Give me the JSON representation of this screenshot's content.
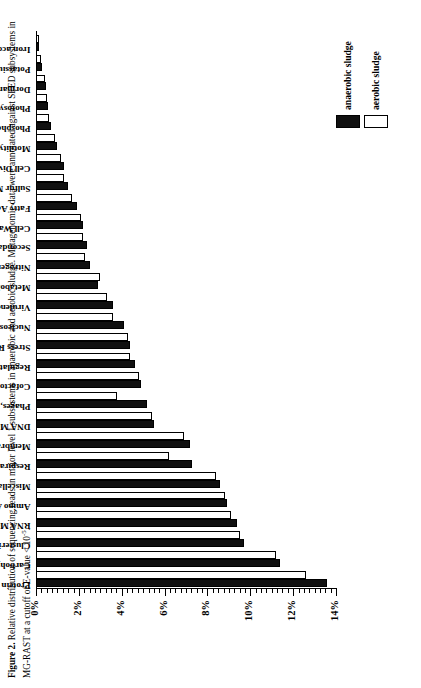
{
  "caption": {
    "label": "Figure 2.",
    "text": " Relative distribution of sequencing reads in major level 1 subsystems in anaerobic and aerobic sludge. Metagenomic data were annotated against SEED subsystems in MG-RAST at a cutoff of E-value < 10",
    "exponent": "-5",
    "tail": "."
  },
  "legend": {
    "position": "bottom-right",
    "items": [
      {
        "name": "anaerobic sludge",
        "color": "#101010"
      },
      {
        "name": "aerobic sludge",
        "color": "#ffffff"
      }
    ]
  },
  "chart_data": {
    "type": "bar",
    "orientation": "vertical",
    "title": "",
    "xlabel": "",
    "ylabel": "",
    "ylim": [
      0,
      14
    ],
    "ytick_labels": [
      "0%",
      "2%",
      "4%",
      "6%",
      "8%",
      "10%",
      "12%",
      "14%"
    ],
    "ytick_values": [
      0,
      2,
      4,
      6,
      8,
      10,
      12,
      14
    ],
    "grid": false,
    "minor_ticks": true,
    "categories": [
      "Protein Metabolism",
      "Carbohydrates",
      "Clustering-based subsystems",
      "RNA Metabolism",
      "Amino Acids and Derivatives",
      "Miscellaneous",
      "Respiration",
      "Membrane Transport",
      "DNA Metabolism",
      "Phages, Prophages, Transposable elements, Plasmids",
      "Cofactors, Vitamins, Prosthetic Groups, Pigments",
      "Regulation and Cell signaling",
      "Stress Response",
      "Nucleosides and Nucleotides",
      "Virulence, Disease and Defense",
      "Metabolism of Aromatic Compounds",
      "Nitrogen Metabolism",
      "Secondary Metabolism",
      "Cell Wall and Capsule",
      "Fatty Acids, Lipids, and Isoprenoids",
      "Sulfur Metabolism",
      "Cell Division and Cell Cycle",
      "Motility and Chemotaxis",
      "Phosphorus Metabolism",
      "Photosynthesis",
      "Dormancy and Sporulation",
      "Potassium metabolism",
      "Iron acquisition and metabolism"
    ],
    "series": [
      {
        "name": "anaerobic sludge",
        "color": "#101010",
        "values": [
          13.6,
          11.4,
          9.7,
          9.4,
          8.9,
          8.6,
          7.3,
          7.2,
          5.5,
          5.2,
          4.9,
          4.6,
          4.4,
          4.1,
          3.6,
          2.9,
          2.5,
          2.4,
          2.2,
          1.9,
          1.5,
          1.3,
          1.0,
          0.7,
          0.55,
          0.45,
          0.3,
          0.15
        ]
      },
      {
        "name": "aerobic sludge",
        "color": "#ffffff",
        "values": [
          12.6,
          11.2,
          9.5,
          9.1,
          8.8,
          8.4,
          6.2,
          6.9,
          5.4,
          3.8,
          4.8,
          4.4,
          4.3,
          3.6,
          3.3,
          3.0,
          2.3,
          2.2,
          2.1,
          1.7,
          1.3,
          1.15,
          0.9,
          0.6,
          0.5,
          0.4,
          0.25,
          0.12
        ]
      }
    ]
  }
}
